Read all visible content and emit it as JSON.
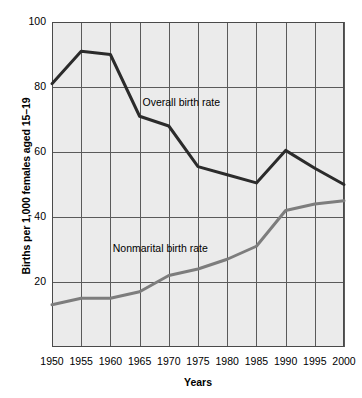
{
  "chart_data": {
    "type": "line",
    "title": "",
    "xlabel": "Years",
    "ylabel": "Births per 1,000 females aged 15–19",
    "x": [
      1950,
      1955,
      1960,
      1965,
      1970,
      1975,
      1980,
      1985,
      1990,
      1995,
      2000
    ],
    "xtick_labels": [
      "1950",
      "1955",
      "1960",
      "1965",
      "1970",
      "1975",
      "1980",
      "1985",
      "1990",
      "1995",
      "2000"
    ],
    "ytick_labels": [
      "20",
      "40",
      "60",
      "80",
      "100"
    ],
    "yticks": [
      20,
      40,
      60,
      80,
      100
    ],
    "xlim": [
      1950,
      2000
    ],
    "ylim": [
      0,
      100
    ],
    "grid": true,
    "legend_position": "inline-annotations",
    "series": [
      {
        "name": "Overall birth rate",
        "color": "#2b2b2b",
        "values": [
          81,
          91,
          90,
          71,
          68,
          55.5,
          53,
          50.5,
          60.5,
          55,
          50
        ],
        "label_x": 1965.5,
        "label_y": 75.5
      },
      {
        "name": "Nonmarital birth rate",
        "color": "#7d7d7d",
        "values": [
          13,
          15,
          15,
          17,
          22,
          24,
          27,
          31,
          42,
          44,
          45
        ],
        "label_x": 1960.4,
        "label_y": 30.5
      }
    ],
    "annotations": [
      {
        "text": "Overall birth rate"
      },
      {
        "text": "Nonmarital birth rate"
      }
    ]
  },
  "style": {
    "plot_background": "#ebebeb",
    "grid_color": "#5a5a5a",
    "axis_color": "#4a4a4a",
    "text_color": "#000000"
  }
}
